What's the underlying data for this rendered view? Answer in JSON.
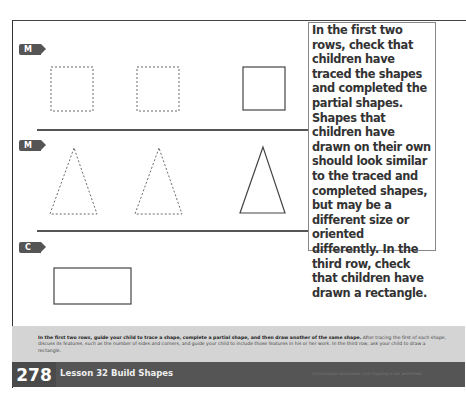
{
  "badges": {
    "row1": "M",
    "row2": "M",
    "row3": "C"
  },
  "annotation": {
    "text": "In the first two rows, check that children have traced the shapes and completed the partial shapes. Shapes that children have drawn on their own should look similar to the traced and completed shapes, but may be a different size or oriented differently. In the third row, check that children have drawn a rectangle."
  },
  "rows": [
    {
      "shapes": [
        "dotted-square",
        "dotted-square",
        "solid-square"
      ]
    },
    {
      "shapes": [
        "dotted-triangle",
        "dotted-triangle",
        "solid-triangle"
      ]
    },
    {
      "shapes": [
        "solid-rectangle"
      ]
    }
  ],
  "footer": {
    "instruction_bold": "In the first two rows, guide your child to trace a shape, complete a partial shape, and then draw another of the same shape.",
    "instruction_rest": " After tracing the first of each shape, discuss its features, such as the number of sides and corners, and guide your child to include those features in his or her work. In the third row, ask your child to draw a rectangle.",
    "page_number": "278",
    "lesson_title": "Lesson 32 Build Shapes",
    "copyright": "©Curriculum Associates, LLC   Copying is not permitted."
  }
}
